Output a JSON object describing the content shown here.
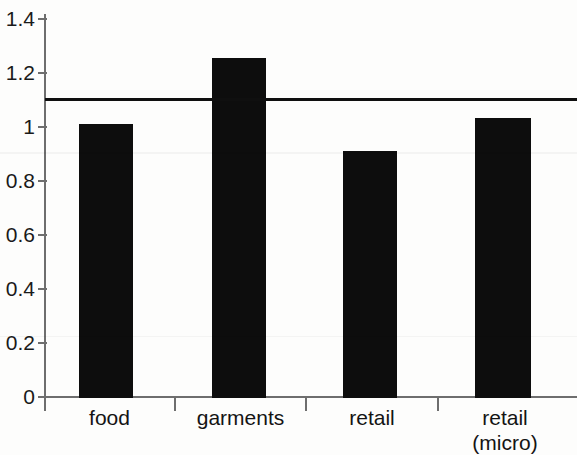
{
  "chart_data": {
    "type": "bar",
    "title": "",
    "subtitle": "",
    "xlabel": "",
    "ylabel": "",
    "categories": [
      "food",
      "garments",
      "retail",
      "retail\n(micro)"
    ],
    "values": [
      1.0,
      1.24,
      0.9,
      1.02
    ],
    "ylim": [
      0,
      1.4
    ],
    "yticks": [
      0,
      0.2,
      0.4,
      0.6,
      0.8,
      1,
      1.2,
      1.4
    ],
    "ytick_labels": [
      "0",
      "0.2",
      "0.4",
      "0.6",
      "0.8",
      "1",
      "1.2",
      "1.4"
    ],
    "grid": false,
    "legend": null,
    "annotations": [
      {
        "type": "horizontal-reference-line",
        "value": 1.09,
        "label": "",
        "color": "#0f0f0f"
      }
    ],
    "series": [
      {
        "name": "",
        "values": [
          1.0,
          1.24,
          0.9,
          1.02
        ],
        "color": "#0d0d0d"
      }
    ],
    "colors": {
      "bar": "#0d0d0d",
      "axis": "#6e6e6e",
      "reference_line": "#0f0f0f",
      "background": "#fdfdfc",
      "text": "#141414"
    }
  }
}
